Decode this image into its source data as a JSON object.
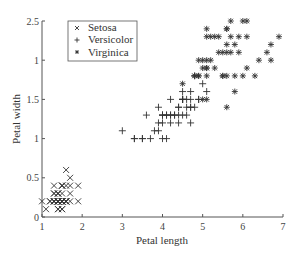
{
  "chart_data": {
    "type": "scatter",
    "title": "",
    "xlabel": "Petal length",
    "ylabel": "Petal width",
    "xlim": [
      1,
      7
    ],
    "ylim": [
      0,
      2.5
    ],
    "xticks": [
      1,
      2,
      3,
      4,
      5,
      6,
      7
    ],
    "xtick_labels": [
      "1",
      "2",
      "3",
      "4",
      "5",
      "6",
      "7"
    ],
    "yticks": [
      0,
      0.5,
      1,
      1.5,
      2,
      2.5
    ],
    "ytick_labels": [
      "0",
      "0.5",
      "1",
      "1.5",
      "1",
      "2.5"
    ],
    "grid": false,
    "legend_position": "upper left",
    "series": [
      {
        "name": "Setosa",
        "marker": "x",
        "points": [
          [
            1.4,
            0.2
          ],
          [
            1.4,
            0.2
          ],
          [
            1.3,
            0.2
          ],
          [
            1.5,
            0.2
          ],
          [
            1.4,
            0.2
          ],
          [
            1.7,
            0.4
          ],
          [
            1.4,
            0.3
          ],
          [
            1.5,
            0.2
          ],
          [
            1.4,
            0.2
          ],
          [
            1.5,
            0.1
          ],
          [
            1.5,
            0.2
          ],
          [
            1.6,
            0.2
          ],
          [
            1.4,
            0.1
          ],
          [
            1.1,
            0.1
          ],
          [
            1.2,
            0.2
          ],
          [
            1.5,
            0.4
          ],
          [
            1.3,
            0.4
          ],
          [
            1.4,
            0.3
          ],
          [
            1.7,
            0.3
          ],
          [
            1.5,
            0.3
          ],
          [
            1.7,
            0.2
          ],
          [
            1.5,
            0.4
          ],
          [
            1.0,
            0.2
          ],
          [
            1.7,
            0.5
          ],
          [
            1.9,
            0.2
          ],
          [
            1.6,
            0.2
          ],
          [
            1.6,
            0.4
          ],
          [
            1.5,
            0.2
          ],
          [
            1.4,
            0.2
          ],
          [
            1.6,
            0.2
          ],
          [
            1.6,
            0.2
          ],
          [
            1.5,
            0.4
          ],
          [
            1.5,
            0.1
          ],
          [
            1.4,
            0.2
          ],
          [
            1.5,
            0.2
          ],
          [
            1.2,
            0.2
          ],
          [
            1.3,
            0.2
          ],
          [
            1.4,
            0.1
          ],
          [
            1.3,
            0.2
          ],
          [
            1.5,
            0.2
          ],
          [
            1.3,
            0.3
          ],
          [
            1.3,
            0.3
          ],
          [
            1.3,
            0.2
          ],
          [
            1.6,
            0.6
          ],
          [
            1.9,
            0.4
          ],
          [
            1.4,
            0.3
          ],
          [
            1.6,
            0.2
          ],
          [
            1.4,
            0.2
          ],
          [
            1.5,
            0.2
          ],
          [
            1.4,
            0.2
          ]
        ]
      },
      {
        "name": "Versicolor",
        "marker": "+",
        "points": [
          [
            4.7,
            1.4
          ],
          [
            4.5,
            1.5
          ],
          [
            4.9,
            1.5
          ],
          [
            4.0,
            1.3
          ],
          [
            4.6,
            1.5
          ],
          [
            4.5,
            1.3
          ],
          [
            4.7,
            1.6
          ],
          [
            3.3,
            1.0
          ],
          [
            4.6,
            1.3
          ],
          [
            3.9,
            1.4
          ],
          [
            3.5,
            1.0
          ],
          [
            4.2,
            1.5
          ],
          [
            4.0,
            1.0
          ],
          [
            4.7,
            1.4
          ],
          [
            3.6,
            1.3
          ],
          [
            4.4,
            1.4
          ],
          [
            4.5,
            1.5
          ],
          [
            4.1,
            1.0
          ],
          [
            4.5,
            1.5
          ],
          [
            3.9,
            1.1
          ],
          [
            4.8,
            1.8
          ],
          [
            4.0,
            1.3
          ],
          [
            4.9,
            1.5
          ],
          [
            4.7,
            1.2
          ],
          [
            4.3,
            1.3
          ],
          [
            4.4,
            1.4
          ],
          [
            4.8,
            1.4
          ],
          [
            5.0,
            1.7
          ],
          [
            4.5,
            1.5
          ],
          [
            3.5,
            1.0
          ],
          [
            3.8,
            1.1
          ],
          [
            3.7,
            1.0
          ],
          [
            3.9,
            1.2
          ],
          [
            5.1,
            1.6
          ],
          [
            4.5,
            1.5
          ],
          [
            4.5,
            1.6
          ],
          [
            4.7,
            1.5
          ],
          [
            4.4,
            1.3
          ],
          [
            4.1,
            1.3
          ],
          [
            4.0,
            1.3
          ],
          [
            4.4,
            1.2
          ],
          [
            4.6,
            1.4
          ],
          [
            4.0,
            1.2
          ],
          [
            3.3,
            1.0
          ],
          [
            4.2,
            1.3
          ],
          [
            4.2,
            1.2
          ],
          [
            4.2,
            1.3
          ],
          [
            4.3,
            1.3
          ],
          [
            3.0,
            1.1
          ],
          [
            4.1,
            1.3
          ]
        ]
      },
      {
        "name": "Virginica",
        "marker": "*",
        "points": [
          [
            6.0,
            2.5
          ],
          [
            5.1,
            1.9
          ],
          [
            5.9,
            2.1
          ],
          [
            5.6,
            1.8
          ],
          [
            5.8,
            2.2
          ],
          [
            6.6,
            2.1
          ],
          [
            4.5,
            1.7
          ],
          [
            6.3,
            1.8
          ],
          [
            5.8,
            1.8
          ],
          [
            6.1,
            2.5
          ],
          [
            5.1,
            2.0
          ],
          [
            5.3,
            1.9
          ],
          [
            5.5,
            2.1
          ],
          [
            5.0,
            2.0
          ],
          [
            5.1,
            2.4
          ],
          [
            5.3,
            2.3
          ],
          [
            5.5,
            1.8
          ],
          [
            6.7,
            2.2
          ],
          [
            6.9,
            2.3
          ],
          [
            5.0,
            1.5
          ],
          [
            5.7,
            2.3
          ],
          [
            4.9,
            2.0
          ],
          [
            6.7,
            2.0
          ],
          [
            4.9,
            1.8
          ],
          [
            5.7,
            2.1
          ],
          [
            6.0,
            1.8
          ],
          [
            4.8,
            1.8
          ],
          [
            4.9,
            1.8
          ],
          [
            5.6,
            2.1
          ],
          [
            5.8,
            1.6
          ],
          [
            6.1,
            1.9
          ],
          [
            6.4,
            2.0
          ],
          [
            5.6,
            2.2
          ],
          [
            5.1,
            1.5
          ],
          [
            5.6,
            1.4
          ],
          [
            6.1,
            2.3
          ],
          [
            5.6,
            2.4
          ],
          [
            5.5,
            1.8
          ],
          [
            4.8,
            1.8
          ],
          [
            5.4,
            2.1
          ],
          [
            5.6,
            2.4
          ],
          [
            5.1,
            2.3
          ],
          [
            5.1,
            1.9
          ],
          [
            5.9,
            2.3
          ],
          [
            5.7,
            2.5
          ],
          [
            5.2,
            2.3
          ],
          [
            5.0,
            1.9
          ],
          [
            5.2,
            2.0
          ],
          [
            5.4,
            2.3
          ],
          [
            5.1,
            1.8
          ]
        ]
      }
    ]
  },
  "legend": {
    "items": [
      {
        "label": "Setosa",
        "marker": "x"
      },
      {
        "label": "Versicolor",
        "marker": "+"
      },
      {
        "label": "Virginica",
        "marker": "*"
      }
    ]
  },
  "axes": {
    "xlabel": "Petal length",
    "ylabel": "Petal width"
  },
  "colors": {
    "ink": "#333333",
    "background": "#ffffff"
  }
}
